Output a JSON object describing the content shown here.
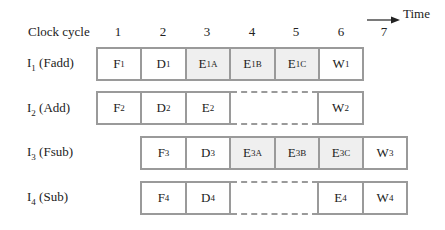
{
  "diagram": {
    "header": {
      "label": "Clock cycle",
      "cycles": [
        "1",
        "2",
        "3",
        "4",
        "5",
        "6",
        "7"
      ],
      "time_label": "Time",
      "time_arrow_icon": "right-arrow-icon"
    },
    "colors": {
      "border": "#9a9a9a",
      "shaded_cell": "#efefef",
      "plain_cell": "#ffffff"
    },
    "rows": [
      {
        "label_main": "I",
        "label_sub": "1",
        "label_rest": " (Fadd)",
        "stages": [
          {
            "type": "cell",
            "col": 1,
            "base": "F",
            "sub": "1",
            "shaded": false
          },
          {
            "type": "cell",
            "col": 2,
            "base": "D",
            "sub": "1",
            "shaded": false
          },
          {
            "type": "cell",
            "col": 3,
            "base": "E",
            "sub": "1A",
            "shaded": true
          },
          {
            "type": "cell",
            "col": 4,
            "base": "E",
            "sub": "1B",
            "shaded": true
          },
          {
            "type": "cell",
            "col": 5,
            "base": "E",
            "sub": "1C",
            "shaded": true
          },
          {
            "type": "cell",
            "col": 6,
            "base": "W",
            "sub": "1",
            "shaded": false
          }
        ]
      },
      {
        "label_main": "I",
        "label_sub": "2",
        "label_rest": " (Add)",
        "stages": [
          {
            "type": "cell",
            "col": 1,
            "base": "F",
            "sub": "2",
            "shaded": false
          },
          {
            "type": "cell",
            "col": 2,
            "base": "D",
            "sub": "2",
            "shaded": false
          },
          {
            "type": "cell",
            "col": 3,
            "base": "E",
            "sub": "2",
            "shaded": false
          },
          {
            "type": "gap",
            "col": 4,
            "span": 2
          },
          {
            "type": "cell",
            "col": 6,
            "base": "W",
            "sub": "2",
            "shaded": false
          }
        ]
      },
      {
        "label_main": "I",
        "label_sub": "3",
        "label_rest": " (Fsub)",
        "stages": [
          {
            "type": "cell",
            "col": 2,
            "base": "F",
            "sub": "3",
            "shaded": false
          },
          {
            "type": "cell",
            "col": 3,
            "base": "D",
            "sub": "3",
            "shaded": false
          },
          {
            "type": "cell",
            "col": 4,
            "base": "E",
            "sub": "3A",
            "shaded": true
          },
          {
            "type": "cell",
            "col": 5,
            "base": "E",
            "sub": "3B",
            "shaded": true
          },
          {
            "type": "cell",
            "col": 6,
            "base": "E",
            "sub": "3C",
            "shaded": true
          },
          {
            "type": "cell",
            "col": 7,
            "base": "W",
            "sub": "3",
            "shaded": false
          }
        ]
      },
      {
        "label_main": "I",
        "label_sub": "4",
        "label_rest": " (Sub)",
        "stages": [
          {
            "type": "cell",
            "col": 2,
            "base": "F",
            "sub": "4",
            "shaded": false
          },
          {
            "type": "cell",
            "col": 3,
            "base": "D",
            "sub": "4",
            "shaded": false
          },
          {
            "type": "gap",
            "col": 4,
            "span": 2
          },
          {
            "type": "cell",
            "col": 6,
            "base": "E",
            "sub": "4",
            "shaded": false
          },
          {
            "type": "cell",
            "col": 7,
            "base": "W",
            "sub": "4",
            "shaded": false
          }
        ]
      }
    ]
  }
}
